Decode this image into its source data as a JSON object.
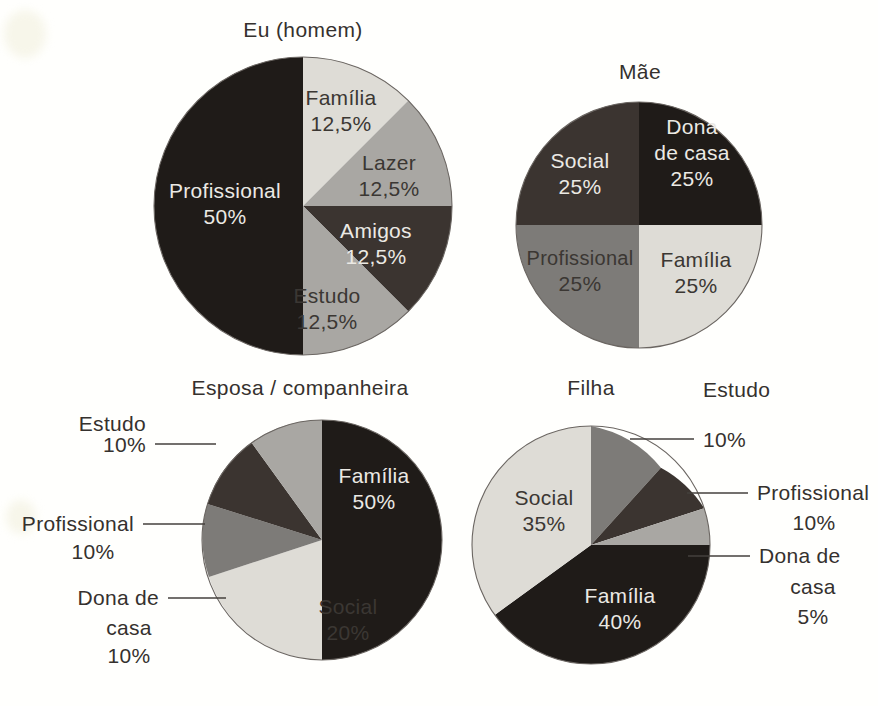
{
  "page": {
    "background_color": "#fffffd",
    "text_color": "#35312e"
  },
  "palette": {
    "darkest": "#1f1b18",
    "dark": "#3b3430",
    "mid_gray": "#7d7b78",
    "light_gray": "#a9a7a3",
    "lightest": "#dedcd6"
  },
  "charts": [
    {
      "id": "eu-homem",
      "title": "Eu (homem)",
      "slices": [
        {
          "label": "Família",
          "percent_text": "12,5%",
          "value": 12.5,
          "color": "#dedcd6",
          "label_style": "dark"
        },
        {
          "label": "Lazer",
          "percent_text": "12,5%",
          "value": 12.5,
          "color": "#a9a7a3",
          "label_style": "dark"
        },
        {
          "label": "Amigos",
          "percent_text": "12,5%",
          "value": 12.5,
          "color": "#3b3430",
          "label_style": "light"
        },
        {
          "label": "Estudo",
          "percent_text": "12,5%",
          "value": 12.5,
          "color": "#a9a7a3",
          "label_style": "dark"
        },
        {
          "label": "Profissional",
          "percent_text": "50%",
          "value": 50,
          "color": "#1f1b18",
          "label_style": "light"
        }
      ]
    },
    {
      "id": "mae",
      "title": "Mãe",
      "slices": [
        {
          "label": "Dona de casa",
          "percent_text": "25%",
          "value": 25,
          "color": "#1f1b18",
          "label_style": "light"
        },
        {
          "label": "Família",
          "percent_text": "25%",
          "value": 25,
          "color": "#dedcd6",
          "label_style": "dark"
        },
        {
          "label": "Profissional",
          "percent_text": "25%",
          "value": 25,
          "color": "#7d7b78",
          "label_style": "dark"
        },
        {
          "label": "Social",
          "percent_text": "25%",
          "value": 25,
          "color": "#3b3430",
          "label_style": "light"
        }
      ]
    },
    {
      "id": "esposa-companheira",
      "title": "Esposa / companheira",
      "slices": [
        {
          "label": "Família",
          "percent_text": "50%",
          "value": 50,
          "color": "#1f1b18",
          "label_style": "light"
        },
        {
          "label": "Social",
          "percent_text": "20%",
          "value": 20,
          "color": "#dedcd6",
          "label_style": "dark"
        },
        {
          "label": "Dona de casa",
          "percent_text": "10%",
          "value": 10,
          "color": "#7d7b78",
          "label_style": "dark"
        },
        {
          "label": "Profissional",
          "percent_text": "10%",
          "value": 10,
          "color": "#3b3430",
          "label_style": "light"
        },
        {
          "label": "Estudo",
          "percent_text": "10%",
          "value": 10,
          "color": "#a9a7a3",
          "label_style": "dark"
        }
      ]
    },
    {
      "id": "filha",
      "title": "Filha",
      "slices": [
        {
          "label": "Estudo",
          "percent_text": "10%",
          "value": 10,
          "color": "#7d7b78",
          "label_style": "dark"
        },
        {
          "label": "Profissional",
          "percent_text": "10%",
          "value": 10,
          "color": "#3b3430",
          "label_style": "light"
        },
        {
          "label": "Dona de casa",
          "percent_text": "5%",
          "value": 5,
          "color": "#a9a7a3",
          "label_style": "dark"
        },
        {
          "label": "Família",
          "percent_text": "40%",
          "value": 40,
          "color": "#1f1b18",
          "label_style": "light"
        },
        {
          "label": "Social",
          "percent_text": "35%",
          "value": 35,
          "color": "#dedcd6",
          "label_style": "dark"
        }
      ]
    }
  ],
  "chart_data": [
    {
      "type": "pie",
      "title": "Eu (homem)",
      "categories": [
        "Família",
        "Lazer",
        "Amigos",
        "Estudo",
        "Profissional"
      ],
      "values": [
        12.5,
        12.5,
        12.5,
        12.5,
        50
      ],
      "value_labels": [
        "12,5%",
        "12,5%",
        "12,5%",
        "12,5%",
        "50%"
      ],
      "units": "percent",
      "legend": "none (labels inside slices)",
      "slice_colors": [
        "#dedcd6",
        "#a9a7a3",
        "#3b3430",
        "#a9a7a3",
        "#1f1b18"
      ],
      "start_angle_deg": 0,
      "direction": "clockwise"
    },
    {
      "type": "pie",
      "title": "Mãe",
      "categories": [
        "Dona de casa",
        "Família",
        "Profissional",
        "Social"
      ],
      "values": [
        25,
        25,
        25,
        25
      ],
      "value_labels": [
        "25%",
        "25%",
        "25%",
        "25%"
      ],
      "units": "percent",
      "legend": "none (labels inside slices)",
      "slice_colors": [
        "#1f1b18",
        "#dedcd6",
        "#7d7b78",
        "#3b3430"
      ],
      "start_angle_deg": 0,
      "direction": "clockwise"
    },
    {
      "type": "pie",
      "title": "Esposa / companheira",
      "categories": [
        "Família",
        "Social",
        "Dona de casa",
        "Profissional",
        "Estudo"
      ],
      "values": [
        50,
        20,
        10,
        10,
        10
      ],
      "value_labels": [
        "50%",
        "20%",
        "10%",
        "10%",
        "10%"
      ],
      "units": "percent",
      "legend": "none (callout labels with leader lines for Estudo, Profissional, Dona de casa)",
      "slice_colors": [
        "#1f1b18",
        "#dedcd6",
        "#7d7b78",
        "#3b3430",
        "#a9a7a3"
      ],
      "start_angle_deg": 0,
      "direction": "clockwise"
    },
    {
      "type": "pie",
      "title": "Filha",
      "categories": [
        "Estudo",
        "Profissional",
        "Dona de casa",
        "Família",
        "Social"
      ],
      "values": [
        10,
        10,
        5,
        40,
        35
      ],
      "value_labels": [
        "10%",
        "10%",
        "5%",
        "40%",
        "35%"
      ],
      "units": "percent",
      "legend": "none (callout labels with leader lines for Estudo, Profissional, Dona de casa)",
      "slice_colors": [
        "#7d7b78",
        "#3b3430",
        "#a9a7a3",
        "#1f1b18",
        "#dedcd6"
      ],
      "start_angle_deg": 0,
      "direction": "clockwise"
    }
  ],
  "callouts": {
    "esposa": [
      {
        "label": "Estudo",
        "percent_text": "10%"
      },
      {
        "label": "Profissional",
        "percent_text": "10%"
      },
      {
        "label": "Dona de",
        "label2": "casa",
        "percent_text": "10%"
      }
    ],
    "filha": [
      {
        "label": "Estudo",
        "percent_text": "10%"
      },
      {
        "label": "Profissional",
        "percent_text": "10%"
      },
      {
        "label": "Dona de",
        "label2": "casa",
        "percent_text": "5%"
      }
    ]
  }
}
